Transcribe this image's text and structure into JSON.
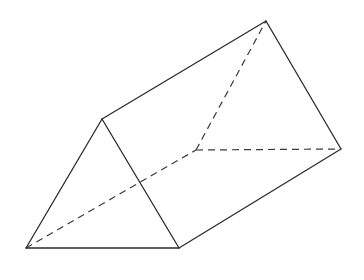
{
  "diagram": {
    "vertices": {
      "A": [
        102,
        119
      ],
      "B": [
        26,
        248
      ],
      "C": [
        179,
        248
      ],
      "D": [
        266,
        21
      ],
      "E": [
        341,
        149
      ],
      "F": [
        196,
        150
      ]
    },
    "visible_edges": [
      [
        "A",
        "B"
      ],
      [
        "B",
        "C"
      ],
      [
        "A",
        "C"
      ],
      [
        "A",
        "D"
      ],
      [
        "D",
        "E"
      ],
      [
        "C",
        "E"
      ]
    ],
    "hidden_edges": [
      [
        "B",
        "F"
      ],
      [
        "F",
        "D"
      ],
      [
        "F",
        "E"
      ]
    ],
    "colors": {
      "line": "#2b2b2b",
      "background": "#ffffff"
    }
  }
}
